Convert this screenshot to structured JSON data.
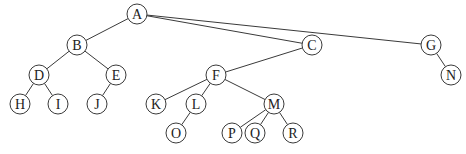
{
  "diagram": {
    "type": "tree",
    "root": "A",
    "node_radius": 10,
    "colors": {
      "stroke": "#3a3a3a",
      "text": "#222222",
      "fill": "#ffffff",
      "background": "#ffffff"
    },
    "nodes": [
      {
        "id": "A",
        "label": "A",
        "x": 137,
        "y": 14
      },
      {
        "id": "B",
        "label": "B",
        "x": 77,
        "y": 45
      },
      {
        "id": "C",
        "label": "C",
        "x": 312,
        "y": 45
      },
      {
        "id": "G",
        "label": "G",
        "x": 431,
        "y": 45
      },
      {
        "id": "D",
        "label": "D",
        "x": 39,
        "y": 75
      },
      {
        "id": "E",
        "label": "E",
        "x": 116,
        "y": 75
      },
      {
        "id": "F",
        "label": "F",
        "x": 216,
        "y": 75
      },
      {
        "id": "N",
        "label": "N",
        "x": 451,
        "y": 75
      },
      {
        "id": "H",
        "label": "H",
        "x": 20,
        "y": 104
      },
      {
        "id": "I",
        "label": "I",
        "x": 58,
        "y": 104
      },
      {
        "id": "J",
        "label": "J",
        "x": 97,
        "y": 104
      },
      {
        "id": "K",
        "label": "K",
        "x": 156,
        "y": 104
      },
      {
        "id": "L",
        "label": "L",
        "x": 196,
        "y": 104
      },
      {
        "id": "M",
        "label": "M",
        "x": 274,
        "y": 104
      },
      {
        "id": "O",
        "label": "O",
        "x": 176,
        "y": 133
      },
      {
        "id": "P",
        "label": "P",
        "x": 232,
        "y": 133
      },
      {
        "id": "Q",
        "label": "Q",
        "x": 255,
        "y": 133
      },
      {
        "id": "R",
        "label": "R",
        "x": 293,
        "y": 133
      }
    ],
    "edges": [
      [
        "A",
        "B"
      ],
      [
        "A",
        "C"
      ],
      [
        "A",
        "G"
      ],
      [
        "B",
        "D"
      ],
      [
        "B",
        "E"
      ],
      [
        "D",
        "H"
      ],
      [
        "D",
        "I"
      ],
      [
        "E",
        "J"
      ],
      [
        "C",
        "F"
      ],
      [
        "F",
        "K"
      ],
      [
        "F",
        "L"
      ],
      [
        "F",
        "M"
      ],
      [
        "L",
        "O"
      ],
      [
        "M",
        "P"
      ],
      [
        "M",
        "Q"
      ],
      [
        "M",
        "R"
      ],
      [
        "G",
        "N"
      ]
    ]
  }
}
